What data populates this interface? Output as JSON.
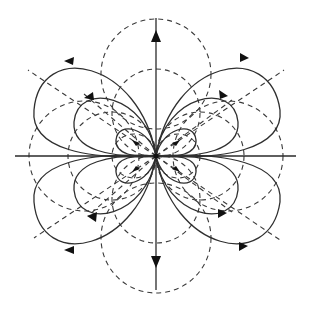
{
  "figure": {
    "title": "Field lines and equipotentials of a quadrupole-like source",
    "width": 310,
    "height": 311,
    "center": [
      156,
      156
    ],
    "colors": {
      "background": "#ffffff",
      "field_line": "#2f2f2f",
      "equipotential": "#3a3a3a",
      "arrowhead": "#111111",
      "axis": "#2a2a2a"
    }
  },
  "axes": {
    "vertical": {
      "from": [
        156,
        18
      ],
      "to": [
        156,
        290
      ]
    },
    "horizontal": {
      "from": [
        15,
        156
      ],
      "to": [
        296,
        156
      ]
    }
  },
  "field_loops": {
    "count_per_quadrant": 3,
    "quadrants": [
      "top-left",
      "top-right",
      "bottom-left",
      "bottom-right"
    ],
    "arrow_direction": {
      "top-left": "clockwise-toward-center",
      "top-right": "outward-right",
      "bottom-left": "toward-left",
      "bottom-right": "outward-right"
    }
  },
  "equipotentials": {
    "style": "dashed",
    "vertical_circles": 3,
    "horizontal_circles": 3
  },
  "radial_lines": {
    "style": "dashed",
    "angles_deg": [
      30,
      150,
      210,
      330,
      60,
      120,
      240,
      300
    ]
  },
  "axis_arrows": {
    "up": {
      "position": [
        156,
        36
      ],
      "direction": "up"
    },
    "down": {
      "position": [
        156,
        262
      ],
      "direction": "down"
    }
  }
}
